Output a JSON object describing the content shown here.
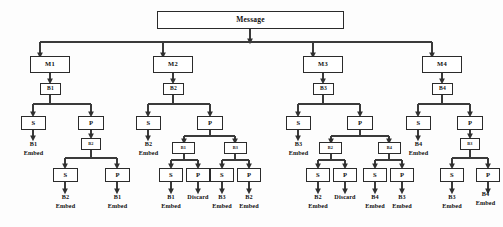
{
  "diagram": {
    "title": "Message",
    "type": "tree",
    "root": {
      "label": "Message"
    },
    "colors": {
      "background": "#fdfdfd",
      "box_border": "#2b2b2b",
      "box_fill": "#ffffff",
      "edge": "#3a3a3a",
      "text": "#111111"
    },
    "labels": {
      "s": "S",
      "p": "P",
      "embed": "Embed",
      "discard": "Discard"
    },
    "branches": [
      {
        "id": "m1",
        "message": "M1",
        "block": "B1",
        "s_child": {
          "op": "S",
          "leaf_top": "B1",
          "leaf_bottom": "Embed"
        },
        "p_child": {
          "op": "P",
          "sub_block": "B2",
          "children": [
            {
              "op": "S",
              "leaf_top": "B2",
              "leaf_bottom": "Embed"
            },
            {
              "op": "P",
              "leaf_top": "B1",
              "leaf_bottom": "Embed"
            }
          ]
        }
      },
      {
        "id": "m2",
        "message": "M2",
        "block": "B2",
        "s_child": {
          "op": "S",
          "leaf_top": "B2",
          "leaf_bottom": "Embed"
        },
        "p_child": {
          "op": "P",
          "sub_blocks": [
            {
              "label": "B1",
              "children": [
                {
                  "op": "S",
                  "leaf_top": "B1",
                  "leaf_bottom": "Embed"
                },
                {
                  "op": "P",
                  "leaf_top": "Discard",
                  "leaf_bottom": ""
                }
              ]
            },
            {
              "label": "B3",
              "children": [
                {
                  "op": "S",
                  "leaf_top": "B3",
                  "leaf_bottom": "Embed"
                },
                {
                  "op": "P",
                  "leaf_top": "B2",
                  "leaf_bottom": "Embed"
                }
              ]
            }
          ]
        }
      },
      {
        "id": "m3",
        "message": "M3",
        "block": "B3",
        "s_child": {
          "op": "S",
          "leaf_top": "B3",
          "leaf_bottom": "Embed"
        },
        "p_child": {
          "op": "P",
          "sub_blocks": [
            {
              "label": "B2",
              "children": [
                {
                  "op": "S",
                  "leaf_top": "B2",
                  "leaf_bottom": "Embed"
                },
                {
                  "op": "P",
                  "leaf_top": "Discard",
                  "leaf_bottom": ""
                }
              ]
            },
            {
              "label": "B4",
              "children": [
                {
                  "op": "S",
                  "leaf_top": "B4",
                  "leaf_bottom": "Embed"
                },
                {
                  "op": "P",
                  "leaf_top": "B3",
                  "leaf_bottom": "Embed"
                }
              ]
            }
          ]
        }
      },
      {
        "id": "m4",
        "message": "M4",
        "block": "B4",
        "s_child": {
          "op": "S",
          "leaf_top": "B4",
          "leaf_bottom": "Embed"
        },
        "p_child": {
          "op": "P",
          "sub_block": "B3",
          "children": [
            {
              "op": "S",
              "leaf_top": "B3",
              "leaf_bottom": "Embed"
            },
            {
              "op": "P",
              "leaf_top": "B4",
              "leaf_bottom": "Embed"
            }
          ]
        }
      }
    ]
  }
}
